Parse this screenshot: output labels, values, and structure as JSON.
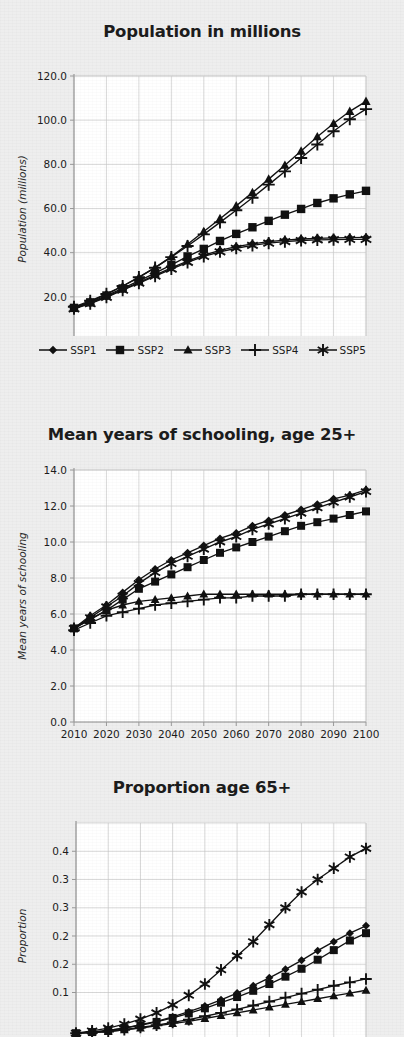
{
  "series_names": [
    "SSP1",
    "SSP2",
    "SSP3",
    "SSP4",
    "SSP5"
  ],
  "legend": {
    "items": [
      {
        "label": "SSP1",
        "marker": "diamond"
      },
      {
        "label": "SSP2",
        "marker": "square"
      },
      {
        "label": "SSP3",
        "marker": "triangle"
      },
      {
        "label": "SSP4",
        "marker": "plus"
      },
      {
        "label": "SSP5",
        "marker": "asterisk"
      }
    ]
  },
  "colors": {
    "ink": "#111111",
    "grid": "#c9c9c9",
    "axis": "#9a9a9a",
    "plot_bg": "#ffffff",
    "page_bg": "#eeeeee"
  },
  "chart_data": [
    {
      "type": "line",
      "title": "Population in millions",
      "xlabel": "",
      "ylabel": "Population (millions)",
      "x": [
        2010,
        2015,
        2020,
        2025,
        2030,
        2035,
        2040,
        2045,
        2050,
        2055,
        2060,
        2065,
        2070,
        2075,
        2080,
        2085,
        2090,
        2095,
        2100
      ],
      "xticks": [
        2010,
        2020,
        2030,
        2040,
        2050,
        2060,
        2070,
        2080,
        2090,
        2100
      ],
      "yticks": [
        "0.0",
        "20.0",
        "40.0",
        "60.0",
        "80.0",
        "100.0",
        "120.0"
      ],
      "ylim": [
        0,
        120
      ],
      "xlim": [
        2010,
        2100
      ],
      "grid": true,
      "legend_position": "below",
      "series": [
        {
          "name": "SSP1",
          "marker": "diamond",
          "values": [
            15.0,
            17.3,
            20.2,
            23.3,
            26.4,
            29.6,
            32.8,
            35.7,
            38.3,
            40.5,
            42.3,
            43.7,
            44.8,
            45.6,
            46.1,
            46.4,
            46.6,
            46.7,
            46.8
          ]
        },
        {
          "name": "SSP2",
          "marker": "square",
          "values": [
            15.0,
            17.6,
            20.6,
            23.8,
            27.1,
            30.6,
            34.2,
            38.0,
            41.8,
            45.4,
            48.7,
            51.6,
            54.2,
            56.4,
            58.4,
            60.0,
            61.4,
            62.6,
            63.6
          ]
        },
        {
          "name": "SSP3",
          "marker": "triangle",
          "values": [
            15.0,
            17.9,
            21.1,
            24.6,
            28.3,
            32.3,
            36.6,
            41.2,
            46.1,
            51.3,
            56.7,
            62.3,
            68.1,
            74.0,
            80.1,
            86.3,
            92.6,
            99.0,
            105.4
          ]
        },
        {
          "name": "SSP4",
          "marker": "plus",
          "values": [
            15.0,
            17.8,
            20.9,
            24.3,
            27.9,
            31.8,
            35.9,
            40.2,
            44.7,
            49.3,
            54.1,
            59.0,
            64.0,
            69.1,
            74.3,
            79.5,
            84.8,
            90.1,
            95.4
          ]
        },
        {
          "name": "SSP5",
          "marker": "asterisk",
          "values": [
            15.0,
            17.4,
            20.3,
            23.5,
            26.7,
            30.0,
            33.3,
            36.4,
            39.2,
            41.6,
            43.6,
            45.2,
            46.4,
            47.3,
            47.9,
            48.4,
            48.7,
            48.9,
            49.0
          ]
        }
      ],
      "series_render": [
        {
          "name": "SSP3",
          "marker": "triangle",
          "values": [
            15.0,
            17.9,
            21.1,
            24.8,
            28.8,
            33.2,
            38.2,
            43.8,
            49.6,
            55.4,
            61.2,
            67.2,
            73.3,
            79.6,
            86.0,
            92.5,
            98.5,
            104.0,
            108.5
          ]
        },
        {
          "name": "SSP4",
          "marker": "plus",
          "values": [
            15.5,
            18.2,
            21.3,
            24.9,
            28.9,
            33.2,
            38.0,
            43.0,
            48.3,
            53.7,
            59.2,
            64.9,
            70.8,
            76.8,
            82.9,
            89.0,
            95.0,
            100.4,
            105.0
          ]
        },
        {
          "name": "SSP2",
          "marker": "square",
          "values": [
            15.0,
            17.5,
            20.6,
            23.8,
            27.2,
            30.7,
            34.5,
            38.3,
            41.7,
            45.3,
            48.5,
            51.5,
            54.4,
            57.2,
            59.8,
            62.5,
            64.6,
            66.4,
            68.0
          ]
        },
        {
          "name": "SSP1",
          "marker": "diamond",
          "values": [
            14.8,
            17.2,
            20.1,
            23.3,
            26.5,
            29.8,
            33.1,
            36.2,
            38.9,
            41.0,
            42.7,
            44.0,
            45.0,
            45.7,
            46.2,
            46.5,
            46.7,
            46.8,
            46.9
          ]
        },
        {
          "name": "SSP5",
          "marker": "asterisk",
          "values": [
            14.6,
            16.9,
            19.8,
            23.0,
            26.2,
            29.4,
            32.6,
            35.6,
            38.3,
            40.4,
            42.0,
            43.3,
            44.3,
            45.0,
            45.5,
            45.8,
            45.9,
            46.0,
            46.0
          ]
        }
      ]
    },
    {
      "type": "line",
      "title": "Mean years of schooling, age 25+",
      "xlabel": "",
      "ylabel": "Mean years of schooling",
      "x": [
        2010,
        2015,
        2020,
        2025,
        2030,
        2035,
        2040,
        2045,
        2050,
        2055,
        2060,
        2065,
        2070,
        2075,
        2080,
        2085,
        2090,
        2095,
        2100
      ],
      "xticks": [
        2010,
        2020,
        2030,
        2040,
        2050,
        2060,
        2070,
        2080,
        2090,
        2100
      ],
      "yticks": [
        "0.0",
        "2.0",
        "4.0",
        "6.0",
        "8.0",
        "10.0",
        "12.0",
        "14.0"
      ],
      "ylim": [
        0,
        14
      ],
      "xlim": [
        2010,
        2100
      ],
      "grid": true,
      "legend_position": "none",
      "series_render": [
        {
          "name": "SSP5",
          "marker": "asterisk",
          "values": [
            5.2,
            5.8,
            6.4,
            7.0,
            7.7,
            8.3,
            8.8,
            9.2,
            9.6,
            10.0,
            10.3,
            10.7,
            11.0,
            11.3,
            11.6,
            11.9,
            12.2,
            12.5,
            12.8
          ]
        },
        {
          "name": "SSP1",
          "marker": "diamond",
          "values": [
            5.2,
            5.9,
            6.5,
            7.2,
            7.9,
            8.5,
            9.0,
            9.4,
            9.8,
            10.2,
            10.5,
            10.9,
            11.2,
            11.5,
            11.8,
            12.1,
            12.4,
            12.6,
            12.9
          ]
        },
        {
          "name": "SSP2",
          "marker": "square",
          "values": [
            5.2,
            5.7,
            6.2,
            6.8,
            7.4,
            7.8,
            8.2,
            8.6,
            9.0,
            9.4,
            9.7,
            10.0,
            10.3,
            10.6,
            10.9,
            11.1,
            11.3,
            11.5,
            11.7
          ]
        },
        {
          "name": "SSP3",
          "marker": "triangle",
          "values": [
            5.2,
            5.7,
            6.2,
            6.5,
            6.7,
            6.8,
            6.9,
            7.0,
            7.1,
            7.1,
            7.1,
            7.1,
            7.1,
            7.1,
            7.1,
            7.1,
            7.1,
            7.1,
            7.1
          ]
        },
        {
          "name": "SSP4",
          "marker": "plus",
          "values": [
            5.1,
            5.5,
            5.9,
            6.1,
            6.3,
            6.5,
            6.6,
            6.7,
            6.8,
            6.9,
            6.9,
            7.0,
            7.0,
            7.0,
            7.1,
            7.1,
            7.1,
            7.1,
            7.1
          ]
        }
      ]
    },
    {
      "type": "line",
      "title": "Proportion age 65+",
      "xlabel": "",
      "ylabel": "Proportion",
      "x": [
        2010,
        2015,
        2020,
        2025,
        2030,
        2035,
        2040,
        2045,
        2050,
        2055,
        2060,
        2065,
        2070,
        2075,
        2080,
        2085,
        2090,
        2095,
        2100
      ],
      "xticks": [
        2010,
        2020,
        2030,
        2040,
        2050,
        2060,
        2070,
        2080,
        2090,
        2100
      ],
      "yticks": [
        "0.1",
        "0.2",
        "0.2",
        "0.3",
        "0.3",
        "0.4"
      ],
      "ytick_values": [
        0.1,
        0.15,
        0.2,
        0.25,
        0.3,
        0.35
      ],
      "ylim": [
        0,
        0.4
      ],
      "xlim": [
        2010,
        2100
      ],
      "grid": true,
      "legend_position": "none",
      "clipped": true,
      "series_render": [
        {
          "name": "SSP5",
          "marker": "asterisk",
          "values": [
            0.028,
            0.032,
            0.037,
            0.044,
            0.053,
            0.064,
            0.078,
            0.095,
            0.115,
            0.14,
            0.165,
            0.19,
            0.22,
            0.25,
            0.278,
            0.3,
            0.32,
            0.34,
            0.355
          ]
        },
        {
          "name": "SSP2",
          "marker": "square",
          "values": [
            0.028,
            0.03,
            0.033,
            0.037,
            0.042,
            0.048,
            0.055,
            0.063,
            0.072,
            0.082,
            0.092,
            0.103,
            0.115,
            0.128,
            0.142,
            0.158,
            0.175,
            0.192,
            0.205
          ]
        },
        {
          "name": "SSP1",
          "marker": "diamond",
          "values": [
            0.028,
            0.03,
            0.033,
            0.037,
            0.043,
            0.049,
            0.057,
            0.066,
            0.076,
            0.087,
            0.099,
            0.112,
            0.126,
            0.141,
            0.157,
            0.174,
            0.19,
            0.205,
            0.218
          ]
        },
        {
          "name": "SSP3",
          "marker": "triangle",
          "values": [
            0.028,
            0.029,
            0.031,
            0.034,
            0.037,
            0.041,
            0.045,
            0.049,
            0.054,
            0.059,
            0.064,
            0.069,
            0.074,
            0.079,
            0.084,
            0.089,
            0.094,
            0.099,
            0.104
          ]
        },
        {
          "name": "SSP4",
          "marker": "plus",
          "values": [
            0.028,
            0.029,
            0.031,
            0.034,
            0.038,
            0.042,
            0.047,
            0.052,
            0.058,
            0.064,
            0.07,
            0.077,
            0.084,
            0.091,
            0.098,
            0.105,
            0.112,
            0.118,
            0.124
          ]
        }
      ]
    }
  ]
}
